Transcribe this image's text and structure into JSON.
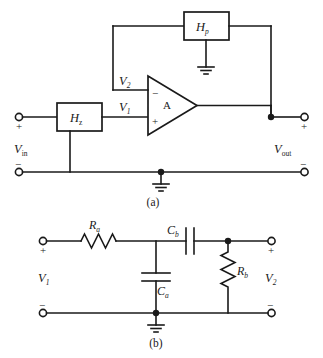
{
  "figure": {
    "colors": {
      "line": "#1a1a1a",
      "background": "#ffffff"
    },
    "panels": [
      {
        "id": "a",
        "caption": "(a)",
        "blocks": [
          {
            "name": "hp-block",
            "label": "H",
            "subscript": "p"
          },
          {
            "name": "hz-block",
            "label": "H",
            "subscript": "z"
          },
          {
            "name": "opamp",
            "label": "A"
          }
        ],
        "node_labels": [
          {
            "name": "v2-label",
            "label": "V",
            "subscript": "2"
          },
          {
            "name": "v1-label",
            "label": "V",
            "subscript": "1"
          }
        ],
        "port_labels": [
          {
            "name": "vin-label",
            "label": "V",
            "subscript": "in",
            "plus": "+",
            "minus": "−"
          },
          {
            "name": "vout-label",
            "label": "V",
            "subscript": "out",
            "plus": "+",
            "minus": "−"
          }
        ],
        "opamp_input_signs": {
          "inverting": "−",
          "noninverting": "+"
        }
      },
      {
        "id": "b",
        "caption": "(b)",
        "components": [
          {
            "name": "resistor-ra",
            "label": "R",
            "subscript": "a",
            "type": "resistor",
            "orientation": "horizontal"
          },
          {
            "name": "capacitor-cb",
            "label": "C",
            "subscript": "b",
            "type": "capacitor",
            "orientation": "horizontal"
          },
          {
            "name": "capacitor-ca",
            "label": "C",
            "subscript": "a",
            "type": "capacitor",
            "orientation": "vertical"
          },
          {
            "name": "resistor-rb",
            "label": "R",
            "subscript": "b",
            "type": "resistor",
            "orientation": "vertical"
          }
        ],
        "port_labels": [
          {
            "name": "v1-port-label",
            "label": "V",
            "subscript": "1",
            "plus": "+",
            "minus": "−"
          },
          {
            "name": "v2-port-label",
            "label": "V",
            "subscript": "2",
            "plus": "+",
            "minus": "−"
          }
        ]
      }
    ]
  }
}
